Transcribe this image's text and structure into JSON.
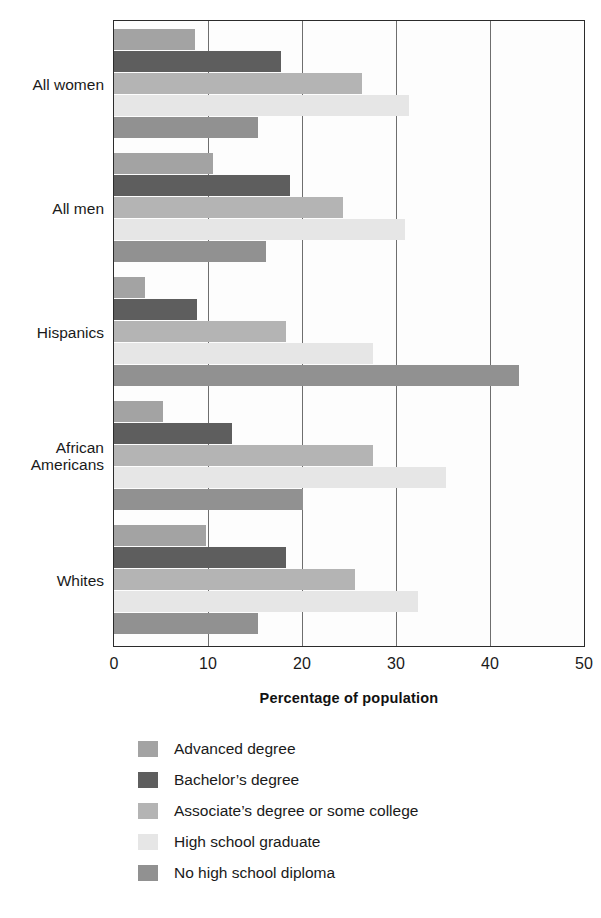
{
  "chart_data": {
    "type": "bar",
    "orientation": "horizontal",
    "title": "",
    "xlabel": "Percentage of population",
    "ylabel": "",
    "xlim": [
      0,
      50
    ],
    "xticks": [
      0,
      10,
      20,
      30,
      40,
      50
    ],
    "grid": "vertical",
    "legend_position": "bottom",
    "categories": [
      "All women",
      "All men",
      "Hispanics",
      "African Americans",
      "Whites"
    ],
    "category_labels_multiline": [
      [
        "All women"
      ],
      [
        "All men"
      ],
      [
        "Hispanics"
      ],
      [
        "African",
        "Americans"
      ],
      [
        "Whites"
      ]
    ],
    "series": [
      {
        "name": "Advanced degree",
        "color": "#a3a3a3",
        "values": [
          8.6,
          10.5,
          3.3,
          5.2,
          9.8
        ]
      },
      {
        "name": "Bachelor’s degree",
        "color": "#5e5e5e",
        "values": [
          17.8,
          18.7,
          8.8,
          12.5,
          18.3
        ]
      },
      {
        "name": "Associate’s degree or some college",
        "color": "#b4b4b4",
        "values": [
          26.4,
          24.4,
          18.3,
          27.5,
          25.6
        ]
      },
      {
        "name": "High school graduate",
        "color": "#e6e6e6",
        "values": [
          31.4,
          31.0,
          27.5,
          35.3,
          32.3
        ]
      },
      {
        "name": "No high school diploma",
        "color": "#919191",
        "values": [
          15.3,
          16.2,
          43.1,
          20.1,
          15.3
        ]
      }
    ]
  },
  "axis": {
    "tick_labels": [
      "0",
      "10",
      "20",
      "30",
      "40",
      "50"
    ],
    "x_title": "Percentage of population"
  },
  "legend": {
    "items": [
      {
        "label": "Advanced degree",
        "color": "#a3a3a3"
      },
      {
        "label": "Bachelor’s degree",
        "color": "#5e5e5e"
      },
      {
        "label": "Associate’s degree or some college",
        "color": "#b4b4b4"
      },
      {
        "label": "High school graduate",
        "color": "#e6e6e6"
      },
      {
        "label": "No high school diploma",
        "color": "#919191"
      }
    ]
  },
  "colors": {
    "plot_border": "#2b2b2b",
    "gridline": "#6e6e6e",
    "background": "#ffffff",
    "text": "#1a1a1a"
  }
}
